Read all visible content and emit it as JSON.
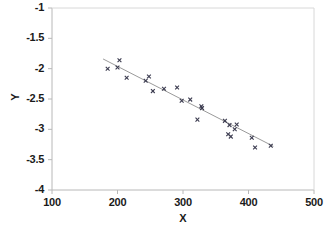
{
  "chart_data": {
    "type": "scatter",
    "title": "",
    "xlabel": "X",
    "ylabel": "Y",
    "xlim": [
      100,
      500
    ],
    "ylim": [
      -4,
      -1
    ],
    "xticks": [
      100,
      200,
      300,
      400,
      500
    ],
    "yticks": [
      -1,
      -1.5,
      -2,
      -2.5,
      -3,
      -3.5,
      -4
    ],
    "xtick_labels": [
      "100",
      "200",
      "300",
      "400",
      "500"
    ],
    "ytick_labels": [
      "-1",
      "-1.5",
      "-2",
      "-2.5",
      "-3",
      "-3.5",
      "-4"
    ],
    "grid": false,
    "legend": null,
    "marker": "x",
    "marker_color": "#3b3b4f",
    "points": [
      {
        "x": 185,
        "y": -2.0
      },
      {
        "x": 203,
        "y": -1.86
      },
      {
        "x": 200,
        "y": -1.98
      },
      {
        "x": 214,
        "y": -2.15
      },
      {
        "x": 243,
        "y": -2.2
      },
      {
        "x": 248,
        "y": -2.13
      },
      {
        "x": 254,
        "y": -2.37
      },
      {
        "x": 271,
        "y": -2.33
      },
      {
        "x": 291,
        "y": -2.31
      },
      {
        "x": 298,
        "y": -2.53
      },
      {
        "x": 311,
        "y": -2.51
      },
      {
        "x": 328,
        "y": -2.62
      },
      {
        "x": 329,
        "y": -2.65
      },
      {
        "x": 322,
        "y": -2.84
      },
      {
        "x": 364,
        "y": -2.86
      },
      {
        "x": 371,
        "y": -2.93
      },
      {
        "x": 382,
        "y": -2.92
      },
      {
        "x": 379,
        "y": -3.0
      },
      {
        "x": 369,
        "y": -3.08
      },
      {
        "x": 373,
        "y": -3.12
      },
      {
        "x": 405,
        "y": -3.14
      },
      {
        "x": 410,
        "y": -3.3
      },
      {
        "x": 434,
        "y": -3.27
      }
    ],
    "fit_line": {
      "x_start": 178,
      "y_start": -1.84,
      "x_end": 438,
      "y_end": -3.28,
      "color": "#9a9a9a"
    },
    "axis_color": "#b8b8b8",
    "text_color": "#1a1a1a"
  }
}
